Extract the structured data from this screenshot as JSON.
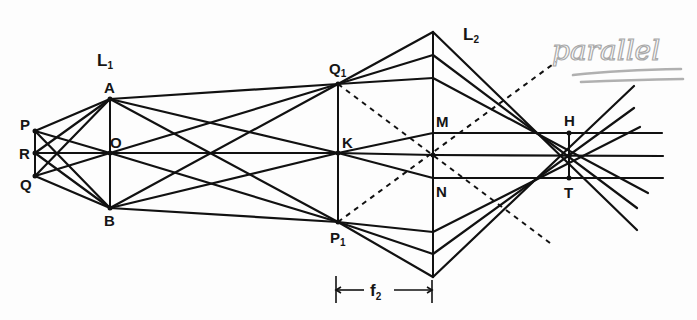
{
  "figure": {
    "lenses": [
      {
        "id": "L1",
        "label": "L",
        "subscript": "1",
        "x": 110,
        "top": 99,
        "bottom": 208
      },
      {
        "id": "L2",
        "label": "L",
        "subscript": "2",
        "x": 433,
        "top": 32,
        "bottom": 277
      }
    ],
    "points": {
      "P": {
        "label": "P",
        "x": 35,
        "y": 131
      },
      "R": {
        "label": "R",
        "x": 35,
        "y": 153
      },
      "Q": {
        "label": "Q",
        "x": 35,
        "y": 176
      },
      "A": {
        "label": "A",
        "x": 110,
        "y": 99
      },
      "O": {
        "label": "O",
        "x": 110,
        "y": 153
      },
      "B": {
        "label": "B",
        "x": 110,
        "y": 208
      },
      "Q1": {
        "label": "Q",
        "subscript": "1",
        "x": 338,
        "y": 84
      },
      "K": {
        "label": "K",
        "x": 338,
        "y": 153
      },
      "P1": {
        "label": "P",
        "subscript": "1",
        "x": 338,
        "y": 222
      },
      "M": {
        "label": "M",
        "x": 433,
        "y": 133
      },
      "N": {
        "label": "N",
        "x": 433,
        "y": 178
      },
      "H": {
        "label": "H",
        "x": 569,
        "y": 133
      },
      "T": {
        "label": "T",
        "x": 569,
        "y": 178
      }
    },
    "dimension": {
      "label": "f",
      "subscript": "2",
      "from_x": 336,
      "to_x": 432,
      "y": 290
    },
    "annotation": {
      "text": "parallel",
      "style": "handwritten pencil, double underlined"
    },
    "colors": {
      "ink": "#111111",
      "pencil": "#a9a9a9",
      "paper": "#fdfdfd"
    }
  }
}
